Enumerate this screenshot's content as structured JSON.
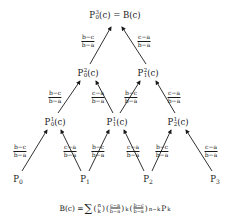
{
  "diagram": {
    "type": "de Casteljau / Bernstein triangular scheme",
    "nodes": {
      "top": {
        "base": "P",
        "sup": "3",
        "sub": "0",
        "arg": "(c)",
        "equals": " = B(c)"
      },
      "level2": [
        {
          "base": "P",
          "sup": "2",
          "sub": "0",
          "arg": "(c)"
        },
        {
          "base": "P",
          "sup": "2",
          "sub": "1",
          "arg": "(c)"
        }
      ],
      "level1": [
        {
          "base": "P",
          "sup": "1",
          "sub": "0",
          "arg": "(c)"
        },
        {
          "base": "P",
          "sup": "1",
          "sub": "1",
          "arg": "(c)"
        },
        {
          "base": "P",
          "sup": "1",
          "sub": "2",
          "arg": "(c)"
        }
      ],
      "level0": [
        {
          "base": "P",
          "sub": "0"
        },
        {
          "base": "P",
          "sub": "1"
        },
        {
          "base": "P",
          "sub": "2"
        },
        {
          "base": "P",
          "sub": "3"
        }
      ]
    },
    "weights": {
      "left": {
        "num": "b−c",
        "den": "b−a"
      },
      "right": {
        "num": "c−a",
        "den": "b−a"
      }
    },
    "formula": {
      "lhs": "B(c) = ",
      "sigma": "∑",
      "binom_top": "n",
      "binom_bottom": "k",
      "frac1_num": "c−a",
      "frac1_den": "b−a",
      "exp1": "k",
      "frac2_num": "b−c",
      "frac2_den": "b−a",
      "exp2": "n−k",
      "tail_base": "P",
      "tail_sub": "k"
    },
    "colors": {
      "ink": "#1a1a1a",
      "background": "#ffffff"
    }
  }
}
